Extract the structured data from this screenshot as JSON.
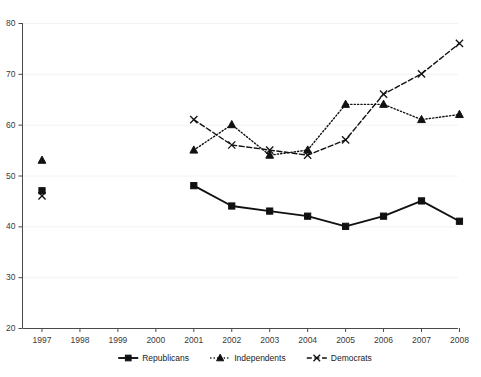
{
  "chart_data": {
    "type": "line",
    "title": "",
    "subtitle": "",
    "xlabel": "",
    "ylabel": "",
    "x": [
      1997,
      1998,
      1999,
      2000,
      2001,
      2002,
      2003,
      2004,
      2005,
      2006,
      2007,
      2008
    ],
    "categories": [
      "1997",
      "1998",
      "1999",
      "2000",
      "2001",
      "2002",
      "2003",
      "2004",
      "2005",
      "2006",
      "2007",
      "2008"
    ],
    "xlim": [
      1996.5,
      2008.6
    ],
    "ylim": [
      20,
      80
    ],
    "yticks": [
      20,
      30,
      40,
      50,
      60,
      70,
      80
    ],
    "ytick_labels": [
      "20",
      "30",
      "40",
      "50",
      "60",
      "70",
      "80"
    ],
    "grid": true,
    "grid_axis": "y",
    "legend_position": "bottom",
    "series": [
      {
        "name": "Republicans",
        "marker": "square",
        "line_style": "solid",
        "color": "#111111",
        "points": [
          {
            "x": 1997,
            "y": 47
          },
          {
            "x": 2001,
            "y": 48
          },
          {
            "x": 2002,
            "y": 44
          },
          {
            "x": 2003,
            "y": 43
          },
          {
            "x": 2004,
            "y": 42
          },
          {
            "x": 2005,
            "y": 40
          },
          {
            "x": 2006,
            "y": 42
          },
          {
            "x": 2007,
            "y": 45
          },
          {
            "x": 2008,
            "y": 41
          }
        ],
        "values": [
          47,
          null,
          null,
          null,
          48,
          44,
          43,
          42,
          40,
          42,
          45,
          41
        ]
      },
      {
        "name": "Independents",
        "marker": "triangle",
        "line_style": "dotted",
        "color": "#111111",
        "points": [
          {
            "x": 1997,
            "y": 53
          },
          {
            "x": 2001,
            "y": 55
          },
          {
            "x": 2002,
            "y": 60
          },
          {
            "x": 2003,
            "y": 54
          },
          {
            "x": 2004,
            "y": 55
          },
          {
            "x": 2005,
            "y": 64
          },
          {
            "x": 2006,
            "y": 64
          },
          {
            "x": 2007,
            "y": 61
          },
          {
            "x": 2008,
            "y": 62
          }
        ],
        "values": [
          53,
          null,
          null,
          null,
          55,
          60,
          54,
          55,
          64,
          64,
          61,
          62
        ]
      },
      {
        "name": "Democrats",
        "marker": "cross",
        "line_style": "dashed",
        "color": "#111111",
        "points": [
          {
            "x": 1997,
            "y": 46
          },
          {
            "x": 2001,
            "y": 61
          },
          {
            "x": 2002,
            "y": 56
          },
          {
            "x": 2003,
            "y": 55
          },
          {
            "x": 2004,
            "y": 54
          },
          {
            "x": 2005,
            "y": 57
          },
          {
            "x": 2006,
            "y": 66
          },
          {
            "x": 2007,
            "y": 70
          },
          {
            "x": 2008,
            "y": 76
          }
        ],
        "values": [
          46,
          null,
          null,
          null,
          61,
          56,
          55,
          54,
          57,
          66,
          70,
          76
        ]
      }
    ]
  },
  "legend": {
    "items": [
      {
        "label": "Republicans",
        "marker": "square",
        "line_style": "solid"
      },
      {
        "label": "Independents",
        "marker": "triangle",
        "line_style": "dotted"
      },
      {
        "label": "Democrats",
        "marker": "cross",
        "line_style": "dashed"
      }
    ]
  },
  "colors": {
    "ink": "#111111",
    "axis": "#4a4a4a",
    "grid": "#f2f2f2",
    "background": "#ffffff",
    "tick_text": "#3a3a3a"
  }
}
